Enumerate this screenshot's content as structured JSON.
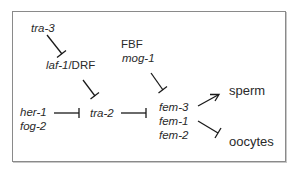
{
  "diagram": {
    "title": "",
    "nodes": {
      "tra3": "tra-3",
      "laf1": "laf-1",
      "slash": "/",
      "drf": "DRF",
      "fbf": "FBF",
      "mog1": "mog-1",
      "her1": "her-1",
      "fog2": "fog-2",
      "tra2": "tra-2",
      "fem3": "fem-3",
      "fem1": "fem-1",
      "fem2": "fem-2",
      "sperm": "sperm",
      "oocytes": "oocytes"
    },
    "edges": [
      {
        "from": "tra-3",
        "to": "laf-1/DRF",
        "type": "inhibition"
      },
      {
        "from": "laf-1/DRF",
        "to": "tra-2",
        "type": "inhibition"
      },
      {
        "from": "her-1/fog-2",
        "to": "tra-2",
        "type": "inhibition"
      },
      {
        "from": "tra-2",
        "to": "fem-3/fem-1/fem-2",
        "type": "inhibition"
      },
      {
        "from": "FBF/mog-1",
        "to": "fem-3/fem-1/fem-2",
        "type": "inhibition"
      },
      {
        "from": "fem-3/fem-1/fem-2",
        "to": "sperm",
        "type": "activation"
      },
      {
        "from": "fem-3/fem-1/fem-2",
        "to": "oocytes",
        "type": "inhibition"
      }
    ],
    "colors": {
      "line": "#1a1a1a",
      "border": "#8a8a8a"
    }
  }
}
